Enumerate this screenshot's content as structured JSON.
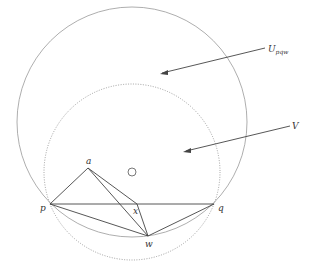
{
  "labels": {
    "U": "U",
    "U_sub": "pqw",
    "V": "V",
    "a": "a",
    "p": "p",
    "q": "q",
    "x": "x",
    "w": "w"
  },
  "colors": {
    "line": "#444444",
    "circle": "#999999",
    "dotted": "#888888",
    "background": "#ffffff"
  },
  "points": {
    "p": [
      50,
      204
    ],
    "q": [
      214,
      204
    ],
    "w": [
      148,
      236
    ],
    "a": [
      88,
      168
    ],
    "x": [
      137,
      204
    ],
    "o": [
      132,
      172
    ]
  }
}
